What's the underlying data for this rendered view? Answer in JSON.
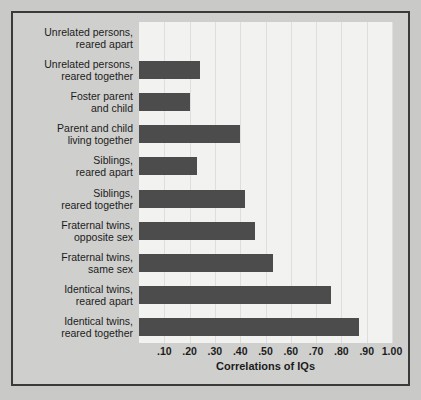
{
  "chart_data": {
    "type": "bar",
    "orientation": "horizontal",
    "title": "",
    "xlabel": "Correlations of IQs",
    "ylabel": "",
    "xlim": [
      0,
      1.0
    ],
    "xticks": [
      ".10",
      ".20",
      ".30",
      ".40",
      ".50",
      ".60",
      ".70",
      ".80",
      ".90",
      "1.00"
    ],
    "xtick_values": [
      0.1,
      0.2,
      0.3,
      0.4,
      0.5,
      0.6,
      0.7,
      0.8,
      0.9,
      1.0
    ],
    "grid": true,
    "legend": false,
    "bar_color": "#4c4c4c",
    "plot_background": "#f2f2f0",
    "figure_background": "#cfcfcd",
    "categories": [
      "Unrelated persons, reared apart",
      "Unrelated persons, reared together",
      "Foster parent and child",
      "Parent and child living together",
      "Siblings, reared apart",
      "Siblings, reared together",
      "Fraternal twins, opposite sex",
      "Fraternal twins, same sex",
      "Identical twins, reared apart",
      "Identical twins, reared together"
    ],
    "category_lines": [
      [
        "Unrelated persons,",
        "reared apart"
      ],
      [
        "Unrelated persons,",
        "reared together"
      ],
      [
        "Foster parent",
        "and child"
      ],
      [
        "Parent and child",
        "living together"
      ],
      [
        "Siblings,",
        "reared apart"
      ],
      [
        "Siblings,",
        "reared together"
      ],
      [
        "Fraternal twins,",
        "opposite sex"
      ],
      [
        "Fraternal twins,",
        "same sex"
      ],
      [
        "Identical twins,",
        "reared apart"
      ],
      [
        "Identical twins,",
        "reared together"
      ]
    ],
    "values": [
      0.0,
      0.24,
      0.2,
      0.4,
      0.23,
      0.42,
      0.46,
      0.53,
      0.76,
      0.87
    ]
  }
}
